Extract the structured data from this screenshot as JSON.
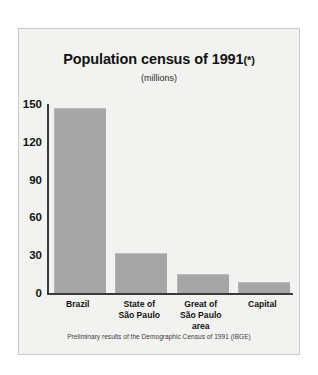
{
  "chart_data": {
    "type": "bar",
    "title": "Population census of 1991",
    "title_marker": "(*)",
    "subtitle": "(millions)",
    "footnote": "Preliminary results of the Demographic Census of 1991 (IBGE)",
    "xlabel": "",
    "ylabel": "",
    "unit": "millions",
    "ylim": [
      0,
      150
    ],
    "yticks": [
      0,
      30,
      60,
      90,
      120,
      150
    ],
    "ytick_labels": [
      "0",
      "30",
      "60",
      "90",
      "120",
      "150"
    ],
    "grid": false,
    "legend": "none",
    "categories": [
      "Brazil",
      "State of\nSão Paulo",
      "Great of\nSão Paulo\narea",
      "Capital"
    ],
    "category_lines": [
      [
        "Brazil"
      ],
      [
        "State of",
        "São Paulo"
      ],
      [
        "Great of",
        "São Paulo",
        "area"
      ],
      [
        "Capital"
      ]
    ],
    "values": [
      147,
      32,
      15,
      9
    ],
    "bar_color": "#a6a6a6",
    "axis_color": "#3a3a3a",
    "panel_color": "#f2f2f0",
    "text_color": "#131313"
  }
}
